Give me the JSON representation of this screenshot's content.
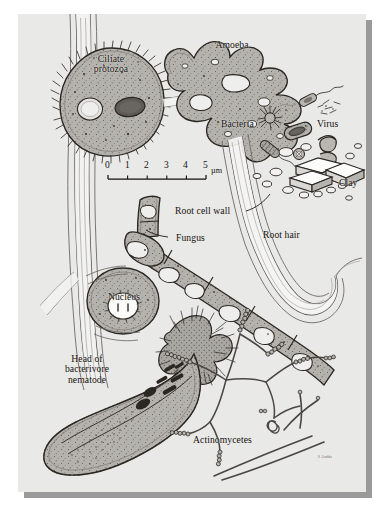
{
  "figure": {
    "medium": "pen-and-ink scientific illustration",
    "background_color": "#e9e9e8",
    "ink_color": "#2a2622",
    "fill_color": "#b4b2ad",
    "page_color": "#ffffff",
    "shadow_color": "#9a9a9a"
  },
  "labels": {
    "ciliate": "Ciliate\nprotozoa",
    "amoeba": "Amoeba",
    "bacteria": "Bacteria",
    "virus": "Virus",
    "clay": "Clay",
    "root_cell_wall": "Root cell wall",
    "root_hair": "Root hair",
    "fungus": "Fungus",
    "nucleus": "Nucleus",
    "nematode": "Head of\nbacterivore\nnematode",
    "actinomycetes": "Actinomycetes"
  },
  "scale_bar": {
    "ticks": [
      "0",
      "1",
      "2",
      "3",
      "4",
      "5"
    ],
    "unit": "µm",
    "min": 0,
    "max": 5
  },
  "signature": "S. Grubbs"
}
